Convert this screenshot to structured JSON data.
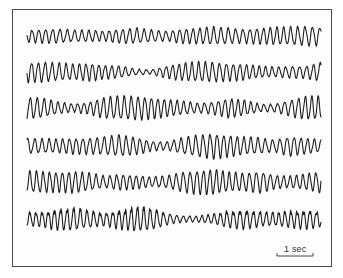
{
  "chart_data": {
    "type": "line",
    "title": "",
    "xlabel": "",
    "ylabel": "",
    "grid": false,
    "legend": null,
    "scale_bar": {
      "label": "1 sec",
      "x1": 277,
      "x2": 313,
      "y": 256
    },
    "x_range_px": [
      27,
      321
    ],
    "series": [
      {
        "name": "trace-1",
        "baseline_y": 36,
        "cycles": 42,
        "envelope": [
          6,
          7,
          7,
          6,
          6,
          5,
          7,
          8,
          6,
          5,
          7,
          8,
          9,
          8,
          7,
          8,
          9,
          9,
          10,
          9
        ]
      },
      {
        "name": "trace-2",
        "baseline_y": 72,
        "cycles": 44,
        "envelope": [
          10,
          10,
          9,
          8,
          9,
          7,
          6,
          3,
          2,
          6,
          9,
          10,
          10,
          9,
          8,
          6,
          5,
          6,
          6,
          10
        ]
      },
      {
        "name": "trace-3",
        "baseline_y": 108,
        "cycles": 44,
        "envelope": [
          11,
          10,
          6,
          4,
          6,
          11,
          12,
          12,
          11,
          9,
          7,
          5,
          6,
          10,
          8,
          4,
          4,
          8,
          12,
          12
        ]
      },
      {
        "name": "trace-4",
        "baseline_y": 146,
        "cycles": 42,
        "envelope": [
          8,
          7,
          7,
          8,
          8,
          9,
          11,
          9,
          5,
          4,
          8,
          11,
          13,
          11,
          9,
          8,
          6,
          10,
          8,
          6
        ]
      },
      {
        "name": "trace-5",
        "baseline_y": 182,
        "cycles": 44,
        "envelope": [
          11,
          11,
          10,
          11,
          9,
          6,
          8,
          7,
          5,
          6,
          10,
          12,
          13,
          10,
          9,
          11,
          7,
          6,
          8,
          11
        ]
      },
      {
        "name": "trace-6",
        "baseline_y": 219,
        "cycles": 46,
        "envelope": [
          7,
          8,
          11,
          12,
          9,
          7,
          10,
          13,
          12,
          6,
          3,
          3,
          5,
          9,
          10,
          8,
          7,
          9,
          10,
          8
        ]
      }
    ]
  },
  "figure": {
    "scale_label": "1 sec"
  }
}
